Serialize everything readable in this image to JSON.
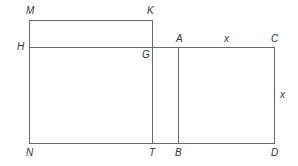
{
  "diagram": {
    "stroke_color": "#6a6a6a",
    "label_color": "#333333",
    "points": {
      "M": {
        "label": "M",
        "x": 29,
        "y": 20
      },
      "K": {
        "label": "K",
        "x": 152,
        "y": 20
      },
      "H": {
        "label": "H",
        "x": 29,
        "y": 47
      },
      "G": {
        "label": "G",
        "x": 152,
        "y": 47
      },
      "A": {
        "label": "A",
        "x": 178,
        "y": 47
      },
      "C": {
        "label": "C",
        "x": 274,
        "y": 47
      },
      "N": {
        "label": "N",
        "x": 29,
        "y": 143
      },
      "T": {
        "label": "T",
        "x": 152,
        "y": 143
      },
      "B": {
        "label": "B",
        "x": 178,
        "y": 143
      },
      "D": {
        "label": "D",
        "x": 274,
        "y": 143
      }
    },
    "segments": [
      [
        "M",
        "K"
      ],
      [
        "M",
        "N"
      ],
      [
        "K",
        "G"
      ],
      [
        "H",
        "C"
      ],
      [
        "G",
        "T"
      ],
      [
        "A",
        "B"
      ],
      [
        "C",
        "D"
      ],
      [
        "N",
        "D"
      ]
    ],
    "labels": {
      "M": "M",
      "K": "K",
      "H": "H",
      "G": "G",
      "A": "A",
      "C": "C",
      "N": "N",
      "T": "T",
      "B": "B",
      "D": "D",
      "side_top": "x",
      "side_right": "x"
    }
  }
}
